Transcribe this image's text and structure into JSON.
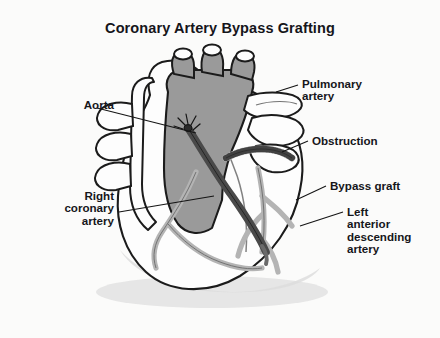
{
  "figure": {
    "title": "Coronary Artery Bypass Grafting",
    "background_color": "#fbfbfa",
    "ink_color": "#16161b"
  },
  "palette": {
    "aorta_fill": "#9a9a9a",
    "vessel_fill": "#b4b4b4",
    "graft_fill": "#4a4a4a",
    "heart_fill": "#fdfdfd",
    "outline": "#1b1b1b",
    "shadow": "#d8d8d8",
    "obstruction_fill": "#c9c9c9"
  },
  "labels": [
    {
      "id": "aorta",
      "text": "Aorta",
      "align": "right",
      "x": 52,
      "y": 99,
      "width": 62
    },
    {
      "id": "right-coronary-artery",
      "text": "Right\ncoronary\nartery",
      "align": "right",
      "x": 30,
      "y": 190,
      "width": 84
    },
    {
      "id": "pulmonary-artery",
      "text": "Pulmonary\nartery",
      "align": "left",
      "x": 302,
      "y": 78,
      "width": 110
    },
    {
      "id": "obstruction",
      "text": "Obstruction",
      "align": "left",
      "x": 312,
      "y": 135,
      "width": 110
    },
    {
      "id": "bypass-graft",
      "text": "Bypass graft",
      "align": "left",
      "x": 330,
      "y": 180,
      "width": 108
    },
    {
      "id": "left-anterior-descending-artery",
      "text": "Left\nanterior\ndescending\nartery",
      "align": "left",
      "x": 347,
      "y": 206,
      "width": 92
    }
  ],
  "anatomy": {
    "parts": [
      "aorta",
      "aortic-arch-branches",
      "superior-vena-cava",
      "pulmonary-artery",
      "right-atrium",
      "right-ventricle",
      "left-ventricle",
      "right-coronary-artery",
      "left-anterior-descending-artery",
      "bypass-graft",
      "obstruction",
      "proximal-anastomosis-sutures",
      "distal-anastomosis"
    ]
  }
}
